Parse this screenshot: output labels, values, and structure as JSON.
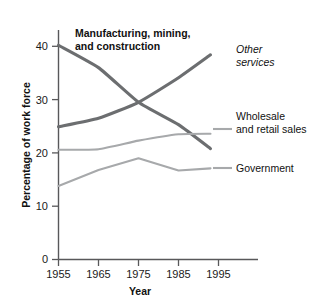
{
  "chart_data": {
    "type": "line",
    "title": "",
    "xlabel": "Year",
    "ylabel": "Percentage of work force",
    "x": [
      1955,
      1965,
      1975,
      1985,
      1993
    ],
    "xlim": [
      1955,
      1999
    ],
    "ylim": [
      0,
      43
    ],
    "xticks": [
      1955,
      1965,
      1975,
      1985,
      1995
    ],
    "yticks": [
      0,
      10,
      20,
      30,
      40
    ],
    "grid": false,
    "legend_position": "inline-annotations",
    "series": [
      {
        "name": "Manufacturing, mining, and construction",
        "label_style": "bold",
        "color": "#6c6e70",
        "values": [
          40.2,
          36.0,
          29.5,
          25.3,
          20.8
        ]
      },
      {
        "name": "Other services",
        "label_style": "italic",
        "color": "#6c6e70",
        "values": [
          24.9,
          26.5,
          29.5,
          34.1,
          38.4
        ]
      },
      {
        "name": "Wholesale and retail sales",
        "label_style": "regular",
        "color": "#a7a9ab",
        "values": [
          20.6,
          20.7,
          22.3,
          23.5,
          23.6
        ]
      },
      {
        "name": "Government",
        "label_style": "regular",
        "color": "#a7a9ab",
        "values": [
          13.8,
          16.8,
          19.0,
          16.7,
          17.1
        ]
      }
    ]
  },
  "axes": {
    "x_title": "Year",
    "y_title": "Percentage of work force",
    "x_tick_labels": [
      "1955",
      "1965",
      "1975",
      "1985",
      "1995"
    ],
    "y_tick_labels": [
      "0",
      "10",
      "20",
      "30",
      "40"
    ]
  },
  "annotations": {
    "manufacturing_line1": "Manufacturing, mining,",
    "manufacturing_line2": "and construction",
    "other_services_line1": "Other",
    "other_services_line2": "services",
    "wholesale_line1": "Wholesale",
    "wholesale_line2": "and retail sales",
    "government": "Government"
  },
  "colors": {
    "dark_series": "#6c6e70",
    "light_series": "#a7a9ab",
    "axis": "#58585a",
    "text": "#111111",
    "background": "#ffffff"
  }
}
